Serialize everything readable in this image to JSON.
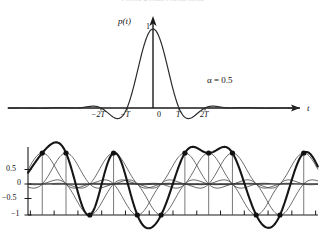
{
  "figure": {
    "cut_off_header": "Figure   Raised cosine pulse",
    "panels": [
      {
        "id": "pulse-panel",
        "role": "single raised-cosine pulse p(t)"
      },
      {
        "id": "pulse-train-panel",
        "role": "superposed raised-cosine pulse train"
      }
    ]
  },
  "top": {
    "ylabel": "p(t)",
    "xlabel": "t",
    "peak_label": "1",
    "annotation": "α = 0.5",
    "xticks": [
      {
        "label": "−2T",
        "x": -2
      },
      {
        "label": "−T",
        "x": -1
      },
      {
        "label": "0",
        "x": 0
      },
      {
        "label": "T",
        "x": 1
      },
      {
        "label": "2T",
        "x": 2
      }
    ]
  },
  "bottom": {
    "yticks": [
      {
        "label": "0.5",
        "value": 0.5
      },
      {
        "label": "0",
        "value": 0
      },
      {
        "label": "−0.5",
        "value": -0.5
      },
      {
        "label": "−1",
        "value": -1
      }
    ],
    "xticks_unlabeled_count": 13
  },
  "colors": {
    "ink": "#111111",
    "axis": "#1a1a1a",
    "thin_curve": "#333333",
    "thick_curve": "#161616",
    "faint_header": "#cfcfcf"
  },
  "chart_data": [
    {
      "type": "line",
      "id": "raised-cosine-pulse",
      "title": "",
      "xlabel": "t",
      "ylabel": "p(t)",
      "annotations": [
        "α = 0.5"
      ],
      "xlim": [
        -4.6,
        4.6
      ],
      "ylim": [
        -0.18,
        1.08
      ],
      "grid": false,
      "legend": null,
      "xtick_labels": [
        "−2T",
        "−T",
        "0",
        "T",
        "2T"
      ],
      "xtick_values": [
        -2,
        -1,
        0,
        1,
        2
      ],
      "ytick_labels": [
        "1"
      ],
      "ytick_values": [
        1
      ],
      "alpha": 0.5,
      "formula": "p(t) = sinc(t/T) * cos(pi*alpha*t/T) / (1 - (2*alpha*t/T)^2)",
      "series": [
        {
          "name": "p(t)",
          "x": [
            -4.6,
            -4.4,
            -4.2,
            -4.0,
            -3.8,
            -3.6,
            -3.4,
            -3.2,
            -3.0,
            -2.8,
            -2.6,
            -2.4,
            -2.2,
            -2.0,
            -1.8,
            -1.6,
            -1.4,
            -1.2,
            -1.0,
            -0.8,
            -0.6,
            -0.4,
            -0.2,
            0.0,
            0.2,
            0.4,
            0.6,
            0.8,
            1.0,
            1.2,
            1.4,
            1.6,
            1.8,
            2.0,
            2.2,
            2.4,
            2.6,
            2.8,
            3.0,
            3.2,
            3.4,
            3.6,
            3.8,
            4.0,
            4.2,
            4.4,
            4.6
          ],
          "y": [
            0.004,
            0.01,
            0.012,
            0.008,
            0.0,
            -0.008,
            -0.013,
            -0.013,
            0.0,
            0.015,
            0.025,
            0.023,
            0.011,
            0.0,
            -0.02,
            -0.042,
            -0.053,
            -0.04,
            0.0,
            0.18,
            0.459,
            0.742,
            0.942,
            1.0,
            0.942,
            0.742,
            0.459,
            0.18,
            0.0,
            -0.04,
            -0.053,
            -0.042,
            -0.02,
            0.0,
            0.011,
            0.023,
            0.025,
            0.015,
            0.0,
            -0.013,
            -0.013,
            -0.008,
            0.0,
            0.008,
            0.012,
            0.01,
            0.004
          ]
        }
      ]
    },
    {
      "type": "line",
      "id": "raised-cosine-pulse-train",
      "title": "",
      "xlabel": "",
      "ylabel": "",
      "grid": false,
      "legend": null,
      "ylim": [
        -1.45,
        1.25
      ],
      "ytick_labels": [
        "0.5",
        "0",
        "−0.5",
        "−1"
      ],
      "ytick_values": [
        0.5,
        0,
        -0.5,
        -1
      ],
      "xtick_labels": [],
      "symbol_interval_T": 1,
      "symbols": [
        1,
        1,
        -1,
        1,
        -1,
        -1,
        1,
        1,
        1,
        -1,
        -1,
        1
      ],
      "sample_marker": "filled-circle",
      "description": "thin curves = individual scaled raised-cosine pulses; thick curve = their sum; dots mark sample instants at +/-1"
    }
  ]
}
